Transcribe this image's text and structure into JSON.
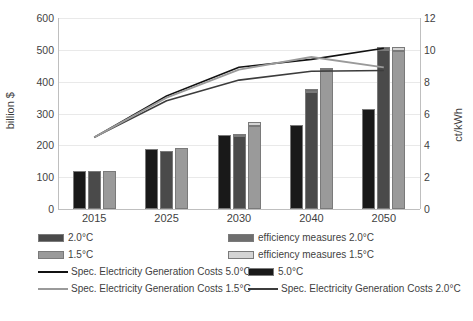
{
  "chart_data": {
    "type": "bar",
    "title": "",
    "categories": [
      "2015",
      "2025",
      "2030",
      "2040",
      "2050"
    ],
    "xlabel": "",
    "ylabel": "billion $",
    "ylim": [
      0,
      600
    ],
    "yticks": [
      0,
      100,
      200,
      300,
      400,
      500,
      600
    ],
    "y2label": "ct/kWh",
    "y2lim": [
      0,
      12
    ],
    "y2ticks": [
      0,
      2,
      4,
      6,
      8,
      10,
      12
    ],
    "grid": true,
    "legend_position": "bottom",
    "bar_series": [
      {
        "name": "5.0°C",
        "color": "#191919",
        "values": [
          120,
          188,
          232,
          265,
          315
        ]
      },
      {
        "name": "2.0°C",
        "color": "#4a4a4a",
        "values": [
          118,
          183,
          228,
          368,
          498
        ]
      },
      {
        "name": "efficiency measures 2.0°C",
        "color": "#6e6e6e",
        "values": [
          0,
          0,
          8,
          10,
          12
        ]
      },
      {
        "name": "1.5°C",
        "color": "#9a9a9a",
        "values": [
          120,
          192,
          262,
          438,
          495
        ]
      },
      {
        "name": "efficiency measures 1.5°C",
        "color": "#d4d4d4",
        "values": [
          0,
          0,
          12,
          6,
          14
        ]
      }
    ],
    "line_series": [
      {
        "name": "Spec. Electricity Generation Costs 5.0°C",
        "color": "#111111",
        "axis": "right",
        "values": [
          4.5,
          7.1,
          8.9,
          9.4,
          10.1
        ]
      },
      {
        "name": "Spec. Electricity Generation Costs 2.0°C",
        "color": "#3c3c3c",
        "axis": "right",
        "values": [
          4.5,
          6.8,
          8.1,
          8.65,
          8.7
        ]
      },
      {
        "name": "Spec. Electricity Generation Costs 1.5°C",
        "color": "#9a9a9a",
        "axis": "right",
        "values": [
          4.5,
          7.0,
          8.75,
          9.55,
          8.9
        ]
      }
    ],
    "legend_entries": [
      {
        "label": "2.0°C",
        "kind": "swatch",
        "color": "#4a4a4a"
      },
      {
        "label": "efficiency measures 2.0°C",
        "kind": "swatch",
        "color": "#6e6e6e"
      },
      {
        "label": "1.5°C",
        "kind": "swatch",
        "color": "#9a9a9a"
      },
      {
        "label": "efficiency measures 1.5°C",
        "kind": "swatch",
        "color": "#d4d4d4"
      },
      {
        "label": "Spec. Electricity Generation Costs 5.0°C",
        "kind": "line",
        "color": "#111111"
      },
      {
        "label": "5.0°C",
        "kind": "swatch",
        "color": "#191919"
      },
      {
        "label": "Spec. Electricity Generation Costs 1.5°C",
        "kind": "line",
        "color": "#9a9a9a"
      },
      {
        "label": "Spec. Electricity Generation Costs 2.0°C",
        "kind": "line",
        "color": "#3c3c3c"
      }
    ]
  }
}
